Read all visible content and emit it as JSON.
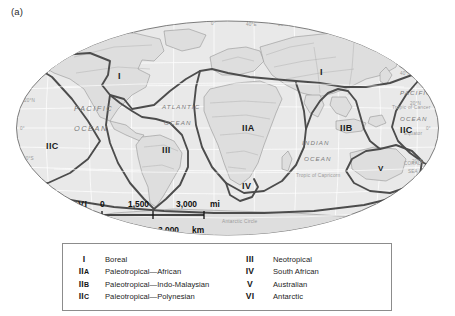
{
  "figure": {
    "panel_label": "(a)",
    "type": "world-map-floristic-kingdoms"
  },
  "map": {
    "projection": "oval",
    "background_color": "#e8e8e8",
    "land_color": "#dcdcdc",
    "boundary_color": "#4a4a4a",
    "graticule_color": "#ffffff",
    "ocean_labels": [
      {
        "id": "pacific-west",
        "line1": "PACIFIC",
        "line2": "OCEAN"
      },
      {
        "id": "atlantic",
        "line1": "ATLANTIC",
        "line2": "OCEAN"
      },
      {
        "id": "indian",
        "line1": "INDIAN",
        "line2": "OCEAN"
      },
      {
        "id": "pacific-east",
        "line1": "PACIFIC",
        "line2": "OCEAN"
      },
      {
        "id": "coral-sea",
        "line1": "CORAL",
        "line2": "SEA"
      }
    ],
    "reference_lines": [
      {
        "id": "tropic-of-cancer",
        "label": "Tropic of Cancer"
      },
      {
        "id": "equator",
        "label": "Equator"
      },
      {
        "id": "tropic-of-capricorn",
        "label": "Tropic of Capricorn"
      },
      {
        "id": "antarctic-circle",
        "label": "Antarctic Circle"
      }
    ],
    "longitude_labels": [
      "120°W",
      "0°",
      "40°E",
      "80°E",
      "120°E",
      "160°E"
    ],
    "latitude_labels_left": [
      "60°N",
      "40°N",
      "20°N",
      "0°",
      "20°S",
      "40°S",
      "60°S"
    ],
    "latitude_labels_right": [
      "40°N",
      "20°N",
      "0°",
      "20°S",
      "60°S"
    ],
    "region_markers": [
      {
        "id": "region-I-northamerica",
        "label": "I"
      },
      {
        "id": "region-I-eurasia",
        "label": "I"
      },
      {
        "id": "region-IIC-west",
        "label": "IIC"
      },
      {
        "id": "region-III",
        "label": "III"
      },
      {
        "id": "region-IIA",
        "label": "IIA"
      },
      {
        "id": "region-IIB",
        "label": "IIB"
      },
      {
        "id": "region-IIC-east",
        "label": "IIC"
      },
      {
        "id": "region-IV",
        "label": "IV"
      },
      {
        "id": "region-V",
        "label": "V"
      },
      {
        "id": "region-VI-left",
        "label": "VI"
      },
      {
        "id": "region-VI-right",
        "label": "VI"
      }
    ]
  },
  "scale_bars": [
    {
      "id": "miles-scale",
      "unit": "mi",
      "ticks": [
        "0",
        "1,500",
        "3,000"
      ],
      "unit_label": "mi"
    },
    {
      "id": "kilometers-scale",
      "unit": "km",
      "ticks": [
        "0",
        "1,500",
        "3,000"
      ],
      "unit_label": "km"
    }
  ],
  "legend": {
    "left_column": [
      {
        "symbol": "I",
        "symbol_sub": "",
        "name": "Boreal"
      },
      {
        "symbol": "II",
        "symbol_sub": "A",
        "name": "Paleotropical—African"
      },
      {
        "symbol": "II",
        "symbol_sub": "B",
        "name": "Paleotropical—Indo-Malaysian"
      },
      {
        "symbol": "II",
        "symbol_sub": "C",
        "name": "Paleotropical—Polynesian"
      }
    ],
    "right_column": [
      {
        "symbol": "III",
        "symbol_sub": "",
        "name": "Neotropical"
      },
      {
        "symbol": "IV",
        "symbol_sub": "",
        "name": "South African"
      },
      {
        "symbol": "V",
        "symbol_sub": "",
        "name": "Australian"
      },
      {
        "symbol": "VI",
        "symbol_sub": "",
        "name": "Antarctic"
      }
    ]
  }
}
